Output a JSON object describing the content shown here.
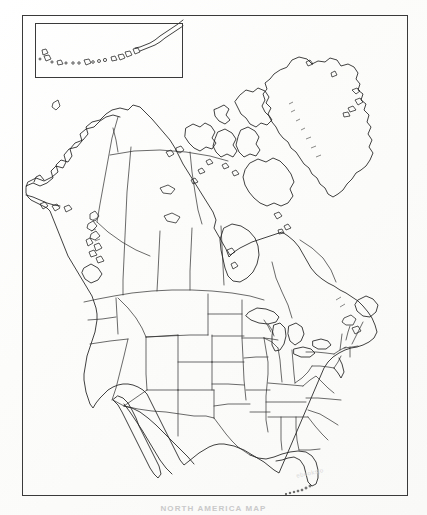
{
  "document": {
    "kind": "map",
    "title": "North America Outline Map",
    "caption": "NORTH AMERICA   MAP",
    "watermark": "ebooksjo",
    "background_color": "#fdfdfc",
    "ink_color": "#1f1f1f",
    "border_color": "#3a3a3a"
  },
  "frame": {
    "name": "map-border",
    "x": 22,
    "y": 15,
    "width": 386,
    "height": 481,
    "stroke_px": 1.4
  },
  "inset": {
    "name": "aleutian-islands-inset",
    "label": "",
    "x": 35,
    "y": 23,
    "width": 148,
    "height": 55,
    "contents": "Aleutian Islands chain of Alaska"
  },
  "map": {
    "projection_style": "conic",
    "shows": "blank political outline map of North America",
    "regions": [
      {
        "name": "alaska",
        "label": "Alaska"
      },
      {
        "name": "canada",
        "label": "Canada"
      },
      {
        "name": "greenland",
        "label": "Greenland"
      },
      {
        "name": "united-states",
        "label": "United States"
      },
      {
        "name": "mexico",
        "label": "Mexico"
      },
      {
        "name": "baja-california",
        "label": "Baja California"
      },
      {
        "name": "florida-keys",
        "label": "Florida Keys"
      },
      {
        "name": "great-lakes",
        "label": "Great Lakes"
      },
      {
        "name": "hudson-bay",
        "label": "Hudson Bay"
      },
      {
        "name": "arctic-archipelago",
        "label": "Canadian Arctic Archipelago"
      },
      {
        "name": "newfoundland",
        "label": "Newfoundland"
      },
      {
        "name": "vancouver-island",
        "label": "Vancouver Island"
      }
    ],
    "boundary_types": [
      {
        "name": "international-border",
        "label": "International border"
      },
      {
        "name": "state-border",
        "label": "State / provincial border"
      },
      {
        "name": "coastline",
        "label": "Coastline"
      }
    ],
    "features": {
      "us_state_borders": true,
      "canadian_province_borders": true,
      "mexican_state_borders": false,
      "city_labels": false,
      "place_names": false,
      "graticule": false,
      "legend": false,
      "scale_bar": false,
      "compass_rose": false
    }
  }
}
